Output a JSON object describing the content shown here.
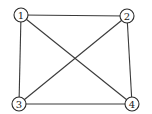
{
  "graph": {
    "type": "undirected",
    "nodes": [
      {
        "id": "1",
        "label": "1",
        "x": 21,
        "y": 15
      },
      {
        "id": "2",
        "label": "2",
        "x": 127,
        "y": 16
      },
      {
        "id": "3",
        "label": "3",
        "x": 19,
        "y": 104
      },
      {
        "id": "4",
        "label": "4",
        "x": 132,
        "y": 104
      }
    ],
    "edges": [
      {
        "from": "1",
        "to": "2"
      },
      {
        "from": "1",
        "to": "3"
      },
      {
        "from": "1",
        "to": "4"
      },
      {
        "from": "2",
        "to": "3"
      },
      {
        "from": "2",
        "to": "4"
      },
      {
        "from": "3",
        "to": "4"
      }
    ],
    "node_radius": 7
  },
  "colors": {
    "edge": "#3a3a3a",
    "node_stroke": "#2a2a2a",
    "node_fill": "#ffffff",
    "label": "#222222",
    "background": "#ffffff"
  }
}
